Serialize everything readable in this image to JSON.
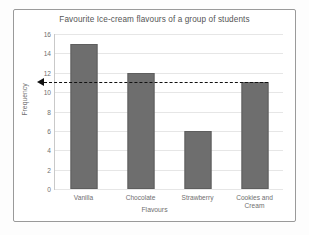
{
  "chart_data": {
    "type": "bar",
    "title": "Favourite Ice-cream flavours of a group of students",
    "xlabel": "Flavours",
    "ylabel": "Frequency",
    "categories": [
      "Vanilla",
      "Chocolate",
      "Strawberry",
      "Cookies and Cream"
    ],
    "values": [
      15,
      12,
      6,
      11
    ],
    "ylim": [
      0,
      16
    ],
    "ytick_labels": [
      "0",
      "2",
      "4",
      "6",
      "8",
      "10",
      "12",
      "14",
      "16"
    ],
    "ytick_values": [
      0,
      2,
      4,
      6,
      8,
      10,
      12,
      14,
      16
    ],
    "grid": true,
    "legend": "none",
    "bar_color": "#6e6e6e",
    "grid_color": "#e6e6e6",
    "annotations": [
      {
        "name": "dashed-value-arrow",
        "style": "dashed-line-with-left-arrowhead",
        "y_value": 11,
        "color": "#111111",
        "from_x_category": "Cookies and Cream",
        "to_axis": "Frequency"
      }
    ]
  },
  "chart": {
    "title": "Favourite Ice-cream flavours of a group of students",
    "xlabel": "Flavours",
    "ylabel": "Frequency"
  }
}
